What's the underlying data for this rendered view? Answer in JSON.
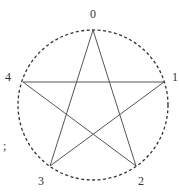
{
  "diagram": {
    "type": "pentagram-on-circle",
    "circle": {
      "cx": 93,
      "cy": 105,
      "r": 75,
      "style": "dashed",
      "color": "#333333"
    },
    "vertices": [
      {
        "id": "0",
        "label": "0",
        "x": 93,
        "y": 30,
        "lx": 93,
        "ly": 18
      },
      {
        "id": "1",
        "label": "1",
        "x": 164,
        "y": 82,
        "lx": 175,
        "ly": 81
      },
      {
        "id": "2",
        "label": "2",
        "x": 136,
        "y": 166,
        "lx": 141,
        "ly": 185
      },
      {
        "id": "3",
        "label": "3",
        "x": 50,
        "y": 166,
        "lx": 41,
        "ly": 185
      },
      {
        "id": "4",
        "label": "4",
        "x": 23,
        "y": 82,
        "lx": 8,
        "ly": 81
      }
    ],
    "edges": [
      [
        "0",
        "2"
      ],
      [
        "2",
        "4"
      ],
      [
        "4",
        "1"
      ],
      [
        "1",
        "3"
      ],
      [
        "3",
        "0"
      ]
    ],
    "edge_color": "#555555",
    "stray_mark": {
      "text": ";",
      "x": 3,
      "y": 150
    }
  }
}
